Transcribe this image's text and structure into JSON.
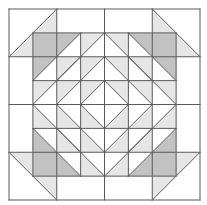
{
  "diagram": {
    "type": "quilt-block",
    "grid_units": 8,
    "origin_px": [
      9,
      9
    ],
    "unit_px": 23.875,
    "colors": {
      "background": "#ffffff",
      "line": "#5a5a5a",
      "light_fill": "#e6e6e6",
      "dark_fill": "#c2c2c2"
    },
    "dark_triangles": [
      [
        [
          1,
          1
        ],
        [
          3,
          1
        ],
        [
          1,
          3
        ]
      ],
      [
        [
          5,
          1
        ],
        [
          7,
          1
        ],
        [
          7,
          3
        ]
      ],
      [
        [
          1,
          5
        ],
        [
          1,
          7
        ],
        [
          3,
          7
        ]
      ],
      [
        [
          7,
          5
        ],
        [
          7,
          7
        ],
        [
          5,
          7
        ]
      ]
    ],
    "light_polygons": [
      [
        [
          2,
          0
        ],
        [
          2,
          1
        ],
        [
          1,
          1
        ],
        [
          1,
          2
        ],
        [
          0,
          2
        ]
      ],
      [
        [
          6,
          0
        ],
        [
          6,
          1
        ],
        [
          7,
          1
        ],
        [
          7,
          2
        ],
        [
          8,
          2
        ]
      ],
      [
        [
          0,
          6
        ],
        [
          1,
          6
        ],
        [
          1,
          7
        ],
        [
          2,
          7
        ],
        [
          2,
          8
        ]
      ],
      [
        [
          8,
          6
        ],
        [
          7,
          6
        ],
        [
          7,
          7
        ],
        [
          6,
          7
        ],
        [
          6,
          8
        ]
      ],
      [
        [
          3,
          1
        ],
        [
          4,
          1
        ],
        [
          3,
          2
        ]
      ],
      [
        [
          2,
          2
        ],
        [
          3,
          2
        ],
        [
          2,
          3
        ]
      ],
      [
        [
          3,
          2
        ],
        [
          4,
          2
        ],
        [
          3,
          3
        ]
      ],
      [
        [
          1,
          3
        ],
        [
          2,
          3
        ],
        [
          1,
          4
        ]
      ],
      [
        [
          2,
          3
        ],
        [
          3,
          3
        ],
        [
          2,
          4
        ]
      ],
      [
        [
          3,
          3
        ],
        [
          4,
          3
        ],
        [
          3,
          4
        ]
      ],
      [
        [
          4,
          1
        ],
        [
          5,
          1
        ],
        [
          5,
          2
        ]
      ],
      [
        [
          5,
          2
        ],
        [
          6,
          2
        ],
        [
          6,
          3
        ]
      ],
      [
        [
          4,
          2
        ],
        [
          5,
          2
        ],
        [
          5,
          3
        ]
      ],
      [
        [
          6,
          3
        ],
        [
          7,
          3
        ],
        [
          7,
          4
        ]
      ],
      [
        [
          5,
          3
        ],
        [
          6,
          3
        ],
        [
          6,
          4
        ]
      ],
      [
        [
          4,
          3
        ],
        [
          5,
          3
        ],
        [
          5,
          4
        ]
      ],
      [
        [
          1,
          4
        ],
        [
          2,
          5
        ],
        [
          1,
          5
        ]
      ],
      [
        [
          2,
          4
        ],
        [
          3,
          5
        ],
        [
          2,
          5
        ]
      ],
      [
        [
          3,
          4
        ],
        [
          4,
          5
        ],
        [
          3,
          5
        ]
      ],
      [
        [
          2,
          5
        ],
        [
          3,
          6
        ],
        [
          2,
          6
        ]
      ],
      [
        [
          3,
          5
        ],
        [
          4,
          6
        ],
        [
          3,
          6
        ]
      ],
      [
        [
          3,
          6
        ],
        [
          4,
          7
        ],
        [
          3,
          7
        ]
      ],
      [
        [
          7,
          4
        ],
        [
          7,
          5
        ],
        [
          6,
          5
        ]
      ],
      [
        [
          6,
          4
        ],
        [
          6,
          5
        ],
        [
          5,
          5
        ]
      ],
      [
        [
          5,
          4
        ],
        [
          5,
          5
        ],
        [
          4,
          5
        ]
      ],
      [
        [
          6,
          5
        ],
        [
          6,
          6
        ],
        [
          5,
          6
        ]
      ],
      [
        [
          5,
          5
        ],
        [
          5,
          6
        ],
        [
          4,
          6
        ]
      ],
      [
        [
          5,
          6
        ],
        [
          5,
          7
        ],
        [
          4,
          7
        ]
      ]
    ],
    "lines": [
      [
        [
          0,
          0
        ],
        [
          8,
          0
        ]
      ],
      [
        [
          0,
          8
        ],
        [
          8,
          8
        ]
      ],
      [
        [
          0,
          0
        ],
        [
          0,
          8
        ]
      ],
      [
        [
          8,
          0
        ],
        [
          8,
          8
        ]
      ],
      [
        [
          0,
          2
        ],
        [
          8,
          2
        ]
      ],
      [
        [
          0,
          4
        ],
        [
          8,
          4
        ]
      ],
      [
        [
          0,
          6
        ],
        [
          8,
          6
        ]
      ],
      [
        [
          2,
          0
        ],
        [
          2,
          8
        ]
      ],
      [
        [
          4,
          0
        ],
        [
          4,
          8
        ]
      ],
      [
        [
          6,
          0
        ],
        [
          6,
          8
        ]
      ],
      [
        [
          1,
          1
        ],
        [
          7,
          1
        ]
      ],
      [
        [
          1,
          3
        ],
        [
          7,
          3
        ]
      ],
      [
        [
          1,
          5
        ],
        [
          7,
          5
        ]
      ],
      [
        [
          1,
          7
        ],
        [
          7,
          7
        ]
      ],
      [
        [
          1,
          1
        ],
        [
          1,
          7
        ]
      ],
      [
        [
          3,
          1
        ],
        [
          3,
          7
        ]
      ],
      [
        [
          5,
          1
        ],
        [
          5,
          7
        ]
      ],
      [
        [
          7,
          1
        ],
        [
          7,
          7
        ]
      ],
      [
        [
          2,
          0
        ],
        [
          0,
          2
        ]
      ],
      [
        [
          6,
          0
        ],
        [
          8,
          2
        ]
      ],
      [
        [
          0,
          6
        ],
        [
          2,
          8
        ]
      ],
      [
        [
          8,
          6
        ],
        [
          6,
          8
        ]
      ],
      [
        [
          3,
          1
        ],
        [
          1,
          3
        ]
      ],
      [
        [
          5,
          1
        ],
        [
          7,
          3
        ]
      ],
      [
        [
          1,
          5
        ],
        [
          3,
          7
        ]
      ],
      [
        [
          7,
          5
        ],
        [
          5,
          7
        ]
      ],
      [
        [
          4,
          1
        ],
        [
          7,
          4
        ]
      ],
      [
        [
          7,
          4
        ],
        [
          4,
          7
        ]
      ],
      [
        [
          4,
          7
        ],
        [
          1,
          4
        ]
      ],
      [
        [
          1,
          4
        ],
        [
          4,
          1
        ]
      ],
      [
        [
          4,
          2
        ],
        [
          6,
          4
        ]
      ],
      [
        [
          6,
          4
        ],
        [
          4,
          6
        ]
      ],
      [
        [
          4,
          6
        ],
        [
          2,
          4
        ]
      ],
      [
        [
          2,
          4
        ],
        [
          4,
          2
        ]
      ],
      [
        [
          4,
          3
        ],
        [
          5,
          4
        ]
      ],
      [
        [
          5,
          4
        ],
        [
          4,
          5
        ]
      ],
      [
        [
          4,
          5
        ],
        [
          3,
          4
        ]
      ],
      [
        [
          3,
          4
        ],
        [
          4,
          3
        ]
      ],
      [
        [
          3,
          2
        ],
        [
          2,
          3
        ]
      ],
      [
        [
          5,
          2
        ],
        [
          6,
          3
        ]
      ],
      [
        [
          2,
          5
        ],
        [
          3,
          6
        ]
      ],
      [
        [
          6,
          5
        ],
        [
          5,
          6
        ]
      ]
    ]
  }
}
